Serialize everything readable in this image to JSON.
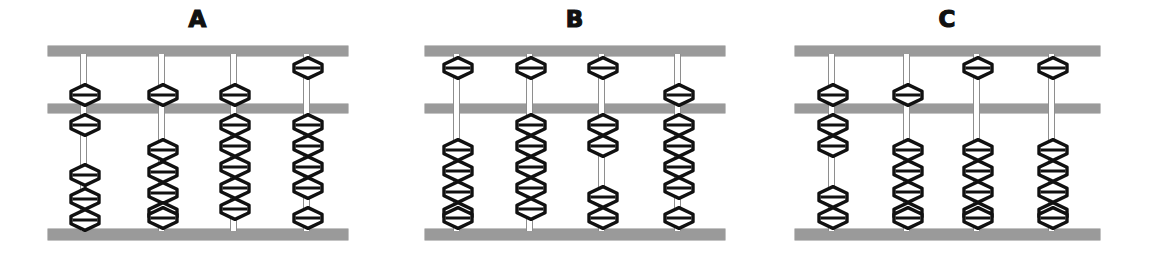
{
  "figure": {
    "background_color": "#ffffff",
    "bar_color": "#9a9a9a",
    "bead_color": "#111111",
    "rod_color": "#8e8e8e",
    "bead_shape": "hexagonal-diamond",
    "layout": {
      "width": 1153,
      "height": 272,
      "beam_top_y": 46,
      "beam_middle_y": 104,
      "beam_bottom_y": 229,
      "upper_deck_beads_per_rod": 1,
      "lower_deck_beads_per_rod": 5
    }
  },
  "abacuses": [
    {
      "label": "A",
      "left": 48,
      "width": 300,
      "rod_xs": [
        82,
        160,
        232,
        305
      ],
      "rods": [
        {
          "index": 1,
          "upper_position": "down",
          "upper_beads": [
            {
              "y": 83
            }
          ],
          "lower_beads": [
            {
              "y": 113
            },
            {
              "y": 163
            },
            {
              "y": 187
            },
            {
              "y": 208
            }
          ],
          "lower_up_count": 1,
          "lower_down_count": 3
        },
        {
          "index": 2,
          "upper_position": "down",
          "upper_beads": [
            {
              "y": 83
            }
          ],
          "lower_beads": [
            {
              "y": 138
            },
            {
              "y": 160
            },
            {
              "y": 181
            },
            {
              "y": 201
            },
            {
              "y": 206
            }
          ],
          "lower_up_count": 0,
          "lower_down_count": 5
        },
        {
          "index": 3,
          "upper_position": "down",
          "upper_beads": [
            {
              "y": 83
            }
          ],
          "lower_beads": [
            {
              "y": 113
            },
            {
              "y": 134
            },
            {
              "y": 155
            },
            {
              "y": 176
            },
            {
              "y": 197
            }
          ],
          "lower_up_count": 5,
          "lower_down_count": 0
        },
        {
          "index": 4,
          "upper_position": "up",
          "upper_beads": [
            {
              "y": 56
            }
          ],
          "lower_beads": [
            {
              "y": 113
            },
            {
              "y": 134
            },
            {
              "y": 155
            },
            {
              "y": 176
            },
            {
              "y": 206
            }
          ],
          "lower_up_count": 4,
          "lower_down_count": 1
        }
      ]
    },
    {
      "label": "B",
      "left": 425,
      "width": 300,
      "rod_xs": [
        455,
        528,
        600,
        676
      ],
      "rods": [
        {
          "index": 1,
          "upper_position": "up",
          "upper_beads": [
            {
              "y": 56
            }
          ],
          "lower_beads": [
            {
              "y": 138
            },
            {
              "y": 159
            },
            {
              "y": 180
            },
            {
              "y": 201
            },
            {
              "y": 206
            }
          ],
          "lower_up_count": 0,
          "lower_down_count": 5
        },
        {
          "index": 2,
          "upper_position": "up",
          "upper_beads": [
            {
              "y": 56
            }
          ],
          "lower_beads": [
            {
              "y": 113
            },
            {
              "y": 134
            },
            {
              "y": 155
            },
            {
              "y": 176
            },
            {
              "y": 197
            }
          ],
          "lower_up_count": 5,
          "lower_down_count": 0
        },
        {
          "index": 3,
          "upper_position": "up",
          "upper_beads": [
            {
              "y": 56
            }
          ],
          "lower_beads": [
            {
              "y": 113
            },
            {
              "y": 134
            },
            {
              "y": 185
            },
            {
              "y": 206
            }
          ],
          "lower_up_count": 2,
          "lower_down_count": 2
        },
        {
          "index": 4,
          "upper_position": "down",
          "upper_beads": [
            {
              "y": 83
            }
          ],
          "lower_beads": [
            {
              "y": 113
            },
            {
              "y": 134
            },
            {
              "y": 155
            },
            {
              "y": 176
            },
            {
              "y": 206
            }
          ],
          "lower_up_count": 4,
          "lower_down_count": 1
        }
      ]
    },
    {
      "label": "C",
      "left": 795,
      "width": 305,
      "rod_xs": [
        830,
        905,
        975,
        1050
      ],
      "rods": [
        {
          "index": 1,
          "upper_position": "down",
          "upper_beads": [
            {
              "y": 83
            }
          ],
          "lower_beads": [
            {
              "y": 113
            },
            {
              "y": 134
            },
            {
              "y": 185
            },
            {
              "y": 206
            }
          ],
          "lower_up_count": 2,
          "lower_down_count": 2
        },
        {
          "index": 2,
          "upper_position": "down",
          "upper_beads": [
            {
              "y": 83
            }
          ],
          "lower_beads": [
            {
              "y": 138
            },
            {
              "y": 159
            },
            {
              "y": 180
            },
            {
              "y": 201
            },
            {
              "y": 206
            }
          ],
          "lower_up_count": 0,
          "lower_down_count": 5
        },
        {
          "index": 3,
          "upper_position": "up",
          "upper_beads": [
            {
              "y": 56
            }
          ],
          "lower_beads": [
            {
              "y": 138
            },
            {
              "y": 159
            },
            {
              "y": 180
            },
            {
              "y": 201
            },
            {
              "y": 206
            }
          ],
          "lower_up_count": 0,
          "lower_down_count": 5
        },
        {
          "index": 4,
          "upper_position": "up",
          "upper_beads": [
            {
              "y": 56
            }
          ],
          "lower_beads": [
            {
              "y": 138
            },
            {
              "y": 159
            },
            {
              "y": 180
            },
            {
              "y": 201
            },
            {
              "y": 206
            }
          ],
          "lower_up_count": 0,
          "lower_down_count": 5
        }
      ]
    }
  ]
}
